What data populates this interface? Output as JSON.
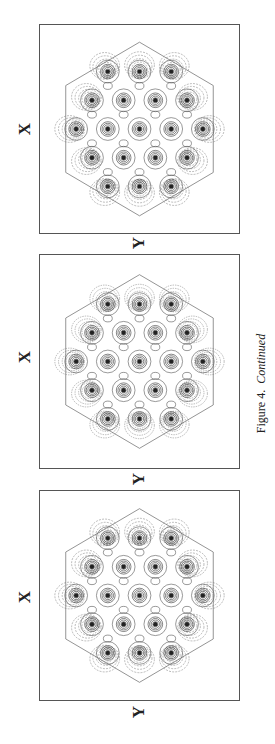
{
  "figure": {
    "caption_label": "Figure 4.",
    "caption_suffix": "Continued",
    "panels": [
      {
        "id": "panel-1",
        "x_label": "X",
        "y_label": "Y"
      },
      {
        "id": "panel-2",
        "x_label": "X",
        "y_label": "Y"
      },
      {
        "id": "panel-3",
        "x_label": "X",
        "y_label": "Y"
      }
    ],
    "atom_rows": [
      3,
      4,
      5,
      4,
      3
    ]
  }
}
